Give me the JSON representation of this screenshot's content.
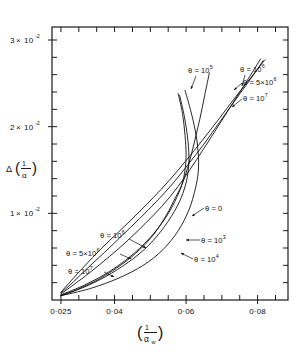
{
  "figure": {
    "background": "#ffffff",
    "ink_color": "#111111"
  },
  "axes": {
    "y_title_main": "Δ",
    "y_title_num": "1",
    "y_title_den": "α",
    "x_title_num": "1",
    "x_title_den": "α",
    "x_title_sub": "w",
    "y_ticks": [
      {
        "value": 0.01,
        "mantissa": "1",
        "times": "×",
        "base": "10",
        "exp": "-2",
        "label": "1×10⁻²"
      },
      {
        "value": 0.02,
        "mantissa": "2",
        "times": "×",
        "base": "10",
        "exp": "-2",
        "label": "2×10⁻²"
      },
      {
        "value": 0.03,
        "mantissa": "3",
        "times": "×",
        "base": "10",
        "exp": "-2",
        "label": "3×10⁻²"
      }
    ],
    "x_ticks": [
      {
        "value": 0.025,
        "label": "0·025"
      },
      {
        "value": 0.04,
        "label": "0·04"
      },
      {
        "value": 0.06,
        "label": "0·06"
      },
      {
        "value": 0.08,
        "label": "0·08"
      }
    ]
  },
  "labels": [
    {
      "id": "theta-1e5",
      "theta": "θ",
      "eq": "=",
      "mantissa": "10",
      "exp": "5",
      "text": "θ=10⁵",
      "x": 188,
      "y": 73
    },
    {
      "id": "theta-1e6-top",
      "theta": "θ",
      "eq": "=",
      "mantissa": "10",
      "exp": "6",
      "text": "θ=10⁶",
      "x": 240,
      "y": 72
    },
    {
      "id": "theta-5e6-top",
      "theta": "θ",
      "eq": "=",
      "mantissa": "5×10",
      "exp": "6",
      "text": "θ=5×10⁶",
      "x": 243,
      "y": 85
    },
    {
      "id": "theta-1e7-top",
      "theta": "θ",
      "eq": "=",
      "mantissa": "10",
      "exp": "7",
      "text": "θ=10⁷",
      "x": 243,
      "y": 101
    },
    {
      "id": "theta-0",
      "theta": "θ",
      "eq": "=",
      "mantissa": "0",
      "exp": "",
      "text": "θ=0",
      "x": 205,
      "y": 211
    },
    {
      "id": "theta-1e3",
      "theta": "θ",
      "eq": "=",
      "mantissa": "10",
      "exp": "3",
      "text": "θ=10³",
      "x": 201,
      "y": 243
    },
    {
      "id": "theta-1e4",
      "theta": "θ",
      "eq": "=",
      "mantissa": "10",
      "exp": "4",
      "text": "θ=10⁴",
      "x": 194,
      "y": 262
    },
    {
      "id": "theta-1e6-low",
      "theta": "θ",
      "eq": "=",
      "mantissa": "10",
      "exp": "6",
      "text": "θ=10⁶",
      "x": 100,
      "y": 238
    },
    {
      "id": "theta-5e6-low",
      "theta": "θ",
      "eq": "=",
      "mantissa": "5×10",
      "exp": "6",
      "text": "θ=5×10⁶",
      "x": 66,
      "y": 256
    },
    {
      "id": "theta-1e7-low",
      "theta": "θ",
      "eq": "=",
      "mantissa": "10",
      "exp": "7",
      "text": "θ=10⁷",
      "x": 68,
      "y": 274
    }
  ],
  "chart_data": {
    "type": "line",
    "title": "",
    "xlabel": "(1/α_w)",
    "ylabel": "Δ(1/α)",
    "xlim": [
      0.0225,
      0.0885
    ],
    "ylim": [
      0.0,
      0.0315
    ],
    "grid": false,
    "legend": "inline-annotations",
    "x_tick_values": [
      0.025,
      0.04,
      0.06,
      0.08
    ],
    "y_tick_values": [
      0.01,
      0.02,
      0.03
    ],
    "x_minor_tick_step": 0.005,
    "y_minor_tick_step": 0.002,
    "series": [
      {
        "name": "θ=0",
        "theta": 0,
        "points": [
          [
            0.025,
            0.0005
          ],
          [
            0.03,
            0.0013
          ],
          [
            0.036,
            0.0025
          ],
          [
            0.042,
            0.0041
          ],
          [
            0.047,
            0.0058
          ],
          [
            0.051,
            0.0076
          ],
          [
            0.0545,
            0.0098
          ],
          [
            0.057,
            0.0118
          ],
          [
            0.0588,
            0.0133
          ],
          [
            0.0597,
            0.015
          ],
          [
            0.06,
            0.0168
          ],
          [
            0.0597,
            0.019
          ],
          [
            0.059,
            0.0215
          ],
          [
            0.0578,
            0.0238
          ]
        ]
      },
      {
        "name": "θ=10³",
        "theta": 1000,
        "points": [
          [
            0.025,
            0.0005
          ],
          [
            0.031,
            0.0014
          ],
          [
            0.0375,
            0.0027
          ],
          [
            0.044,
            0.0044
          ],
          [
            0.0495,
            0.0063
          ],
          [
            0.054,
            0.0085
          ],
          [
            0.0575,
            0.0108
          ],
          [
            0.0595,
            0.0128
          ],
          [
            0.0605,
            0.0146
          ],
          [
            0.0608,
            0.0165
          ],
          [
            0.0604,
            0.0188
          ],
          [
            0.0595,
            0.0212
          ],
          [
            0.0582,
            0.0236
          ]
        ]
      },
      {
        "name": "θ=10⁴",
        "theta": 10000,
        "points": [
          [
            0.025,
            0.0005
          ],
          [
            0.033,
            0.0013
          ],
          [
            0.041,
            0.0025
          ],
          [
            0.048,
            0.004
          ],
          [
            0.0535,
            0.0058
          ],
          [
            0.0578,
            0.008
          ],
          [
            0.0608,
            0.0104
          ],
          [
            0.0625,
            0.0127
          ],
          [
            0.0634,
            0.0148
          ],
          [
            0.0634,
            0.017
          ],
          [
            0.0626,
            0.0195
          ],
          [
            0.0612,
            0.022
          ],
          [
            0.0597,
            0.0242
          ]
        ]
      },
      {
        "name": "θ=10⁵",
        "theta": 100000,
        "points": [
          [
            0.025,
            0.0006
          ],
          [
            0.032,
            0.0018
          ],
          [
            0.039,
            0.0034
          ],
          [
            0.0455,
            0.0054
          ],
          [
            0.051,
            0.0077
          ],
          [
            0.0552,
            0.0101
          ],
          [
            0.0582,
            0.0126
          ],
          [
            0.0604,
            0.0152
          ],
          [
            0.0622,
            0.018
          ],
          [
            0.0638,
            0.0208
          ],
          [
            0.0652,
            0.0236
          ],
          [
            0.0665,
            0.0262
          ]
        ]
      },
      {
        "name": "θ=10⁶",
        "theta": 1000000,
        "points": [
          [
            0.025,
            0.0007
          ],
          [
            0.029,
            0.0019
          ],
          [
            0.0335,
            0.0033
          ],
          [
            0.0385,
            0.005
          ],
          [
            0.0435,
            0.0068
          ],
          [
            0.0485,
            0.0088
          ],
          [
            0.0532,
            0.0108
          ],
          [
            0.0572,
            0.0128
          ],
          [
            0.061,
            0.015
          ],
          [
            0.065,
            0.0175
          ],
          [
            0.0692,
            0.0202
          ],
          [
            0.0735,
            0.023
          ],
          [
            0.0775,
            0.0256
          ],
          [
            0.0808,
            0.0278
          ]
        ]
      },
      {
        "name": "θ=5×10⁶",
        "theta": 5000000,
        "points": [
          [
            0.025,
            0.0008
          ],
          [
            0.0285,
            0.0021
          ],
          [
            0.0325,
            0.0037
          ],
          [
            0.0372,
            0.0055
          ],
          [
            0.042,
            0.0074
          ],
          [
            0.047,
            0.0094
          ],
          [
            0.0518,
            0.0114
          ],
          [
            0.0562,
            0.0134
          ],
          [
            0.0605,
            0.0156
          ],
          [
            0.065,
            0.018
          ],
          [
            0.0695,
            0.0206
          ],
          [
            0.074,
            0.0232
          ],
          [
            0.0782,
            0.0256
          ],
          [
            0.0815,
            0.0276
          ]
        ]
      },
      {
        "name": "θ=10⁷",
        "theta": 10000000,
        "points": [
          [
            0.025,
            0.0009
          ],
          [
            0.028,
            0.0023
          ],
          [
            0.0318,
            0.004
          ],
          [
            0.0362,
            0.0059
          ],
          [
            0.041,
            0.0078
          ],
          [
            0.046,
            0.0098
          ],
          [
            0.0508,
            0.0118
          ],
          [
            0.0553,
            0.0138
          ],
          [
            0.0598,
            0.016
          ],
          [
            0.0645,
            0.0184
          ],
          [
            0.0692,
            0.0209
          ],
          [
            0.0738,
            0.0234
          ],
          [
            0.0782,
            0.0257
          ],
          [
            0.082,
            0.0277
          ]
        ]
      }
    ]
  }
}
